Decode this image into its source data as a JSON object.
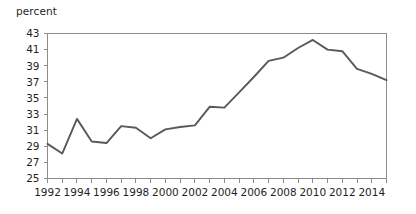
{
  "chart_data": {
    "type": "line",
    "title": "",
    "subtitle": "",
    "xlabel": "",
    "ylabel": "percent",
    "ylim": [
      25,
      43
    ],
    "xlim": [
      1992,
      2015
    ],
    "grid": false,
    "legend": null,
    "y_ticks": [
      25,
      27,
      29,
      31,
      33,
      35,
      37,
      39,
      41,
      43
    ],
    "y_tick_labels": [
      "25",
      "27",
      "29",
      "31",
      "33",
      "35",
      "37",
      "39",
      "41",
      "43"
    ],
    "x_ticks": [
      1992,
      1993,
      1994,
      1995,
      1996,
      1997,
      1998,
      1999,
      2000,
      2001,
      2002,
      2003,
      2004,
      2005,
      2006,
      2007,
      2008,
      2009,
      2010,
      2011,
      2012,
      2013,
      2014,
      2015
    ],
    "x_tick_labels": [
      "1992",
      "1994",
      "1996",
      "1998",
      "2000",
      "2002",
      "2004",
      "2006",
      "2008",
      "2010",
      "2012",
      "2014"
    ],
    "x_labeled_ticks": [
      1992,
      1994,
      1996,
      1998,
      2000,
      2002,
      2004,
      2006,
      2008,
      2010,
      2012,
      2014
    ],
    "x": [
      1992,
      1993,
      1994,
      1995,
      1996,
      1997,
      1998,
      1999,
      2000,
      2001,
      2002,
      2003,
      2004,
      2005,
      2006,
      2007,
      2008,
      2009,
      2010,
      2011,
      2012,
      2013,
      2014,
      2015
    ],
    "values": [
      29.3,
      28.1,
      32.4,
      29.6,
      29.4,
      31.5,
      31.3,
      30.0,
      31.1,
      31.4,
      31.6,
      33.9,
      33.8,
      35.7,
      37.6,
      39.6,
      40.0,
      41.2,
      42.2,
      41.0,
      40.8,
      38.6,
      38.0,
      37.2
    ],
    "series": [
      {
        "name": "percent",
        "color": "#595959",
        "values": [
          29.3,
          28.1,
          32.4,
          29.6,
          29.4,
          31.5,
          31.3,
          30.0,
          31.1,
          31.4,
          31.6,
          33.9,
          33.8,
          35.7,
          37.6,
          39.6,
          40.0,
          41.2,
          42.2,
          41.0,
          40.8,
          38.6,
          38.0,
          37.2
        ]
      }
    ],
    "colors": {
      "line": "#595959",
      "axis": "#8c8c8c",
      "text": "#1f1f1f",
      "background": "#ffffff"
    }
  }
}
